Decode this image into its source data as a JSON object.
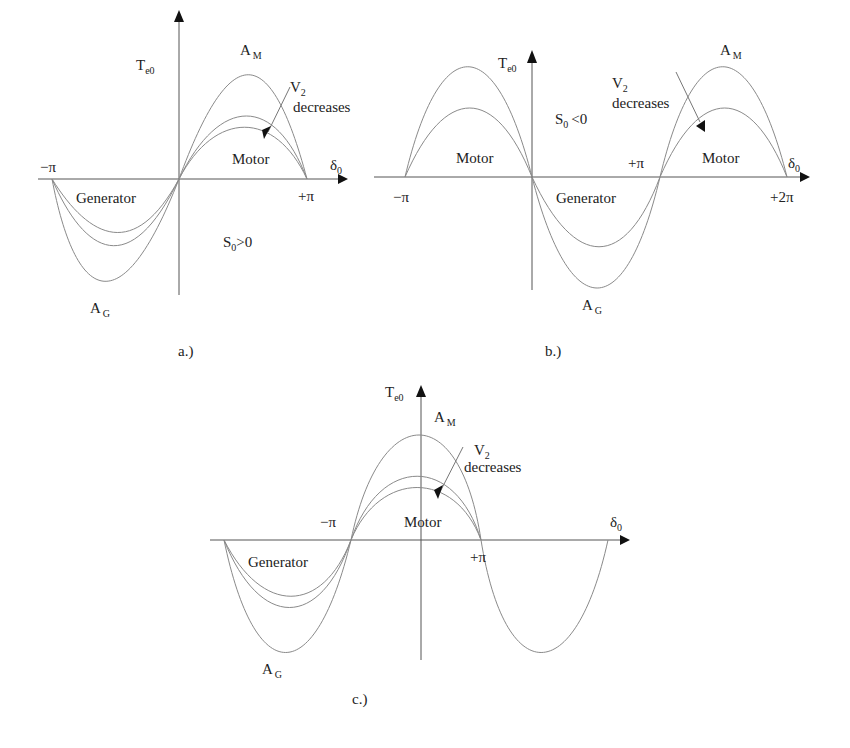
{
  "panels": {
    "a": {
      "caption": "a.)",
      "y_axis_label": "T",
      "y_axis_sub": "e0",
      "x_axis_label": "δ",
      "x_axis_sub": "0",
      "tick_neg_pi": "−π",
      "tick_pos_pi": "+π",
      "peak_label": "A",
      "peak_sub": "M",
      "trough_label": "A",
      "trough_sub": "G",
      "v2_label": "V",
      "v2_sub": "2",
      "v2_text": "decreases",
      "region_motor": "Motor",
      "region_generator": "Generator",
      "slip_label": "S",
      "slip_sub": "0",
      "slip_cond": ">0"
    },
    "b": {
      "caption": "b.)",
      "y_axis_label": "T",
      "y_axis_sub": "e0",
      "x_axis_label": "δ",
      "x_axis_sub": "0",
      "tick_neg_pi": "−π",
      "tick_pos_pi": "+π",
      "tick_2pi": "+2π",
      "peak_label": "A",
      "peak_sub": "M",
      "trough_label": "A",
      "trough_sub": "G",
      "v2_label": "V",
      "v2_sub": "2",
      "v2_text": "decreases",
      "region_motor_left": "Motor",
      "region_motor_right": "Motor",
      "region_generator": "Generator",
      "slip_label": "S",
      "slip_sub": "0",
      "slip_cond": "<0"
    },
    "c": {
      "caption": "c.)",
      "y_axis_label": "T",
      "y_axis_sub": "e0",
      "x_axis_label": "δ",
      "x_axis_sub": "0",
      "tick_neg_pi": "−π",
      "tick_pos_pi": "+π",
      "peak_label": "A",
      "peak_sub": "M",
      "trough_label": "A",
      "trough_sub": "G",
      "v2_label": "V",
      "v2_sub": "2",
      "v2_text": "decreases",
      "region_motor": "Motor",
      "region_generator": "Generator"
    }
  },
  "colors": {
    "curve": "#8a8a8a",
    "axis": "#555555",
    "text": "#222222"
  }
}
